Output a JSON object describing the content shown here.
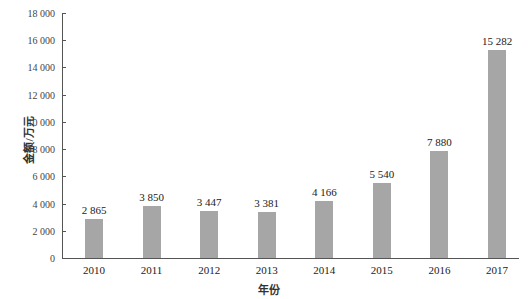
{
  "chart_data": {
    "type": "bar",
    "title": "",
    "xlabel": "年份",
    "ylabel": "金额/万元",
    "categories": [
      "2010",
      "2011",
      "2012",
      "2013",
      "2014",
      "2015",
      "2016",
      "2017"
    ],
    "values": [
      2865,
      3850,
      3447,
      3381,
      4166,
      5540,
      7880,
      15282
    ],
    "value_labels": [
      "2 865",
      "3 850",
      "3 447",
      "3 381",
      "4 166",
      "5 540",
      "7 880",
      "15 282"
    ],
    "ylim": [
      0,
      18000
    ],
    "yticks": [
      0,
      2000,
      4000,
      6000,
      8000,
      10000,
      12000,
      14000,
      16000,
      18000
    ],
    "ytick_labels": [
      "0",
      "2 000",
      "4 000",
      "6 000",
      "8 000",
      "10 000",
      "12 000",
      "14 000",
      "16 000",
      "18 000"
    ],
    "bar_color": "#a6a6a6",
    "grid": false,
    "legend": null
  }
}
